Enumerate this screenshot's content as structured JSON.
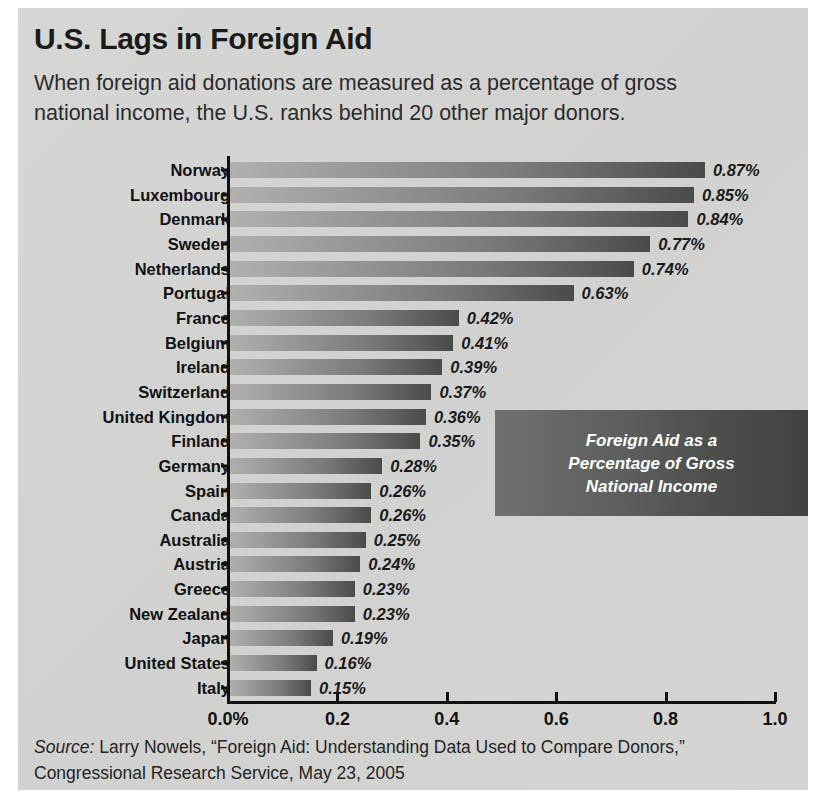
{
  "title": "U.S. Lags in Foreign Aid",
  "subtitle": "When foreign aid donations are measured as a percentage of gross national income, the U.S. ranks behind 20 other major donors.",
  "callout": "Foreign Aid as a\nPercentage of Gross\nNational Income",
  "source": {
    "label": "Source:",
    "text": " Larry Nowels, “Foreign Aid: Understanding Data Used to Compare Donors,” Congressional Research Service, May 23, 2005"
  },
  "colors": {
    "panel_background": "#d3d4d2",
    "bar_light": "#b0b1af",
    "bar_dark": "#4a4b49",
    "callout_light": "#6f716f",
    "callout_dark": "#414341",
    "axis": "#111111",
    "text": "#1b1b1b",
    "callout_text": "#ffffff"
  },
  "chart_data": {
    "type": "bar",
    "orientation": "horizontal",
    "title": "U.S. Lags in Foreign Aid",
    "subtitle": "When foreign aid donations are measured as a percentage of gross national income, the U.S. ranks behind 20 other major donors.",
    "xlabel": "",
    "ylabel": "",
    "xlim": [
      0,
      1.0
    ],
    "grid": false,
    "legend": false,
    "annotation": "Foreign Aid as a Percentage of Gross National Income",
    "xticks": [
      0,
      0.2,
      0.4,
      0.6,
      0.8,
      1.0
    ],
    "xticklabels": [
      "0.0%",
      "0.2",
      "0.4",
      "0.6",
      "0.8",
      "1.0"
    ],
    "categories": [
      "Norway",
      "Luxembourg",
      "Denmark",
      "Sweden",
      "Netherlands",
      "Portugal",
      "France",
      "Belgium",
      "Ireland",
      "Switzerland",
      "United Kingdom",
      "Finland",
      "Germany",
      "Spain",
      "Canada",
      "Australia",
      "Austria",
      "Greece",
      "New Zealand",
      "Japan",
      "United States",
      "Italy"
    ],
    "values": [
      0.87,
      0.85,
      0.84,
      0.77,
      0.74,
      0.63,
      0.42,
      0.41,
      0.39,
      0.37,
      0.36,
      0.35,
      0.28,
      0.26,
      0.26,
      0.25,
      0.24,
      0.23,
      0.23,
      0.19,
      0.16,
      0.15
    ],
    "value_labels": [
      "0.87%",
      "0.85%",
      "0.84%",
      "0.77%",
      "0.74%",
      "0.63%",
      "0.42%",
      "0.41%",
      "0.39%",
      "0.37%",
      "0.36%",
      "0.35%",
      "0.28%",
      "0.26%",
      "0.26%",
      "0.25%",
      "0.24%",
      "0.23%",
      "0.23%",
      "0.19%",
      "0.16%",
      "0.15%"
    ]
  }
}
